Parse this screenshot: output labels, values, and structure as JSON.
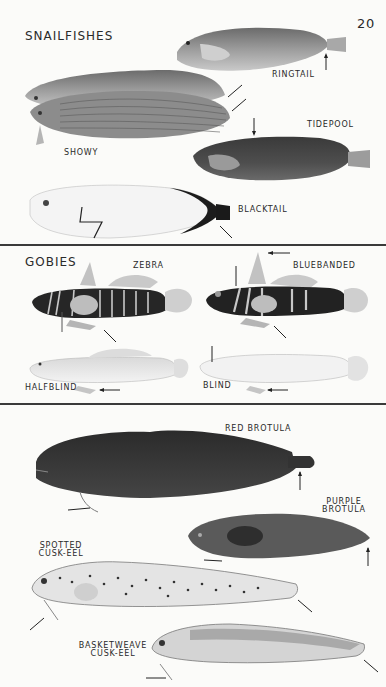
{
  "page_number": "20",
  "sections": [
    {
      "title": "SNAILFISHES",
      "species": [
        {
          "name": "RINGTAIL"
        },
        {
          "name": "SHOWY"
        },
        {
          "name": "TIDEPOOL"
        },
        {
          "name": "BLACKTAIL"
        }
      ]
    },
    {
      "title": "GOBIES",
      "species": [
        {
          "name": "ZEBRA"
        },
        {
          "name": "BLUEBANDED"
        },
        {
          "name": "HALFBLIND"
        },
        {
          "name": "BLIND"
        }
      ]
    },
    {
      "title": "",
      "species": [
        {
          "name": "RED BROTULA"
        },
        {
          "name": "PURPLE",
          "name2": "BROTULA"
        },
        {
          "name": "SPOTTED",
          "name2": "CUSK-EEL"
        },
        {
          "name": "BASKETWEAVE",
          "name2": "CUSK-EEL"
        }
      ]
    }
  ],
  "colors": {
    "paper": "#fbfbf9",
    "ink": "#1e1e1e",
    "rule": "#3a3a3a"
  }
}
